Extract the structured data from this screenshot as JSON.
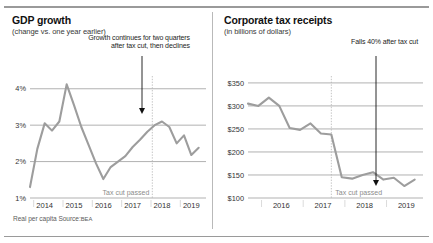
{
  "colors": {
    "line": "#9d9d9d",
    "grid": "#8f8f8f",
    "marker": "#b5b5b5",
    "text": "#1a1a1a",
    "muted": "#8c8c8c"
  },
  "left_panel": {
    "title": "GDP growth",
    "subtitle": "(change vs. one year earlier)",
    "annotation": "Growth continues for two quarters after tax cut, then declines",
    "marker_label": "Tax cut passed",
    "footnote_text": "Real per capita  Source:",
    "footnote_source": "BEA"
  },
  "right_panel": {
    "title": "Corporate tax receipts",
    "subtitle": "(in billions of dollars)",
    "annotation": "Falls 40% after tax cut",
    "marker_label": "Tax cut passed"
  },
  "chart_data": [
    {
      "type": "line",
      "id": "gdp-growth",
      "title": "GDP growth",
      "subtitle": "(change vs. one year earlier)",
      "xlabel": "",
      "ylabel": "",
      "ylim": [
        1,
        4.35
      ],
      "ytick_labels": [
        "4%",
        "3%",
        "2%",
        "1%"
      ],
      "ytick_values": [
        4,
        3,
        2,
        1
      ],
      "xtick_labels": [
        "2014",
        "2015",
        "2016",
        "2017",
        "2018",
        "2019"
      ],
      "xtick_values": [
        2014,
        2015,
        2016,
        2017,
        2018,
        2019
      ],
      "xlim": [
        2013.75,
        2019.75
      ],
      "grid": true,
      "legend": "none",
      "annotation": "Growth continues for two quarters after tax cut, then declines",
      "marker_label": "Tax cut passed",
      "marker_x": 2017.92,
      "footnote": "Real per capita  Source: BEA",
      "units": "percent",
      "x": [
        2013.75,
        2014.0,
        2014.25,
        2014.5,
        2014.75,
        2015.0,
        2015.25,
        2015.5,
        2015.75,
        2016.0,
        2016.25,
        2016.5,
        2016.75,
        2017.0,
        2017.25,
        2017.5,
        2017.75,
        2018.0,
        2018.25,
        2018.5,
        2018.75,
        2019.0,
        2019.25,
        2019.5
      ],
      "values": [
        1.3,
        2.35,
        3.05,
        2.85,
        3.1,
        4.12,
        3.55,
        2.95,
        2.45,
        1.95,
        1.52,
        1.85,
        2.0,
        2.15,
        2.4,
        2.6,
        2.82,
        3.0,
        3.1,
        2.95,
        2.5,
        2.72,
        2.18,
        2.38
      ]
    },
    {
      "type": "line",
      "id": "corporate-tax-receipts",
      "title": "Corporate tax receipts",
      "subtitle": "(in billions of dollars)",
      "xlabel": "",
      "ylabel": "",
      "ylim": [
        100,
        365
      ],
      "ytick_labels": [
        "$350",
        "$300",
        "$250",
        "$200",
        "$150",
        "$100"
      ],
      "ytick_values": [
        350,
        300,
        250,
        200,
        150,
        100
      ],
      "xtick_labels": [
        "2016",
        "2017",
        "2018",
        "2019"
      ],
      "xtick_values": [
        2016,
        2017,
        2018,
        2019
      ],
      "xlim": [
        2015.55,
        2019.75
      ],
      "grid": true,
      "legend": "none",
      "annotation": "Falls 40% after tax cut",
      "marker_label": "Tax cut passed",
      "marker_x": 2017.55,
      "units": "billions of dollars",
      "x": [
        2015.55,
        2015.8,
        2016.05,
        2016.3,
        2016.55,
        2016.8,
        2017.05,
        2017.3,
        2017.55,
        2017.8,
        2018.05,
        2018.3,
        2018.55,
        2018.8,
        2019.05,
        2019.3,
        2019.55
      ],
      "values": [
        305,
        300,
        318,
        300,
        252,
        248,
        262,
        240,
        238,
        145,
        142,
        150,
        156,
        140,
        144,
        126,
        140
      ]
    }
  ]
}
